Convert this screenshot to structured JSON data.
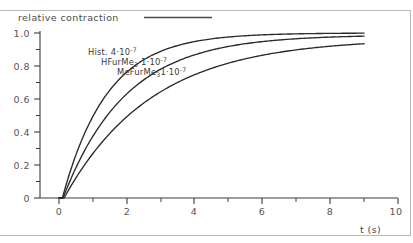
{
  "chart_data": {
    "type": "line",
    "title": "relative contraction",
    "xlabel": "t (s)",
    "ylabel": "relative contraction",
    "xlim": [
      -0.55,
      10.0
    ],
    "ylim": [
      0.0,
      1.04
    ],
    "grid": false,
    "legend_position": "inline-on-curves",
    "x_ticks_major": [
      0,
      2,
      4,
      6,
      8,
      10
    ],
    "x_ticks_major_labels": [
      "0",
      "2",
      "4",
      "6",
      "8",
      "10"
    ],
    "x_ticks_minor": [
      1,
      3,
      5,
      7,
      9
    ],
    "y_ticks_major": [
      0,
      0.2,
      0.4,
      0.6,
      0.8,
      1.0
    ],
    "y_ticks_major_labels": [
      "0",
      "0.2",
      "0.4",
      "0.6",
      "0.8",
      "1.0"
    ],
    "y_ticks_minor": [
      0.1,
      0.3,
      0.5,
      0.7,
      0.9
    ],
    "series": [
      {
        "name": "Hist. 4·10⁻⁷",
        "label_text": "Hist. 4",
        "label_mid": "·10",
        "label_sup": "-7",
        "label_sub": "",
        "tau": 1.32,
        "delay": 0.1,
        "x": [
          0.0,
          0.1,
          0.2,
          0.3,
          0.5,
          0.75,
          1.0,
          1.5,
          2.0,
          2.5,
          3.0,
          3.5,
          4.0,
          5.0,
          6.0,
          7.0,
          8.0,
          9.0
        ],
        "y": [
          0.0,
          0.0,
          0.075,
          0.145,
          0.263,
          0.393,
          0.494,
          0.654,
          0.761,
          0.832,
          0.881,
          0.915,
          0.939,
          0.968,
          0.984,
          0.992,
          0.996,
          0.999
        ]
      },
      {
        "name": "HFurMe₃ 1·10⁻⁷",
        "label_text": "HFurMe",
        "label_mid": " 1·10",
        "label_sup": "-7",
        "label_sub": "3",
        "tau": 1.85,
        "delay": 0.12,
        "x": [
          0.0,
          0.1,
          0.2,
          0.3,
          0.5,
          0.75,
          1.0,
          1.5,
          2.0,
          2.5,
          3.0,
          3.5,
          4.0,
          5.0,
          6.0,
          7.0,
          8.0,
          9.0
        ],
        "y": [
          0.0,
          0.0,
          0.052,
          0.102,
          0.19,
          0.291,
          0.376,
          0.519,
          0.627,
          0.709,
          0.771,
          0.818,
          0.854,
          0.903,
          0.935,
          0.957,
          0.971,
          0.981
        ]
      },
      {
        "name": "MeFurMe₃ 1·10⁻⁷",
        "label_text": "MeFurMe",
        "label_mid": " 1·10",
        "label_sup": "-7",
        "label_sub": "3",
        "tau": 2.6,
        "delay": 0.15,
        "x": [
          0.0,
          0.1,
          0.2,
          0.3,
          0.5,
          0.75,
          1.0,
          1.5,
          2.0,
          2.5,
          3.0,
          3.5,
          4.0,
          5.0,
          6.0,
          7.0,
          8.0,
          9.0
        ],
        "y": [
          0.0,
          0.0,
          0.038,
          0.074,
          0.14,
          0.217,
          0.285,
          0.404,
          0.501,
          0.58,
          0.645,
          0.698,
          0.742,
          0.81,
          0.858,
          0.892,
          0.917,
          0.935
        ]
      }
    ]
  },
  "labels": {
    "y_axis_title": "relative contraction",
    "x_axis_title": "t (s)",
    "series_1": "Hist. 4·10-7",
    "series_2": "HFurMe3 1·10-7",
    "series_3": "MeFurMe3 1·10-7"
  },
  "colors": {
    "curve": "#2a2a2a",
    "axis": "#3c3c3c",
    "text": "#4a4a4a",
    "frame": "#b9b9b9",
    "background": "#ffffff"
  }
}
